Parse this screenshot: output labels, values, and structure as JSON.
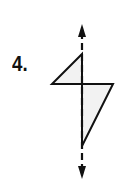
{
  "problem": {
    "number_label": "4."
  },
  "figure": {
    "shape": "kite",
    "symmetry_line": "vertical dashed line with arrowheads at both ends",
    "colors": {
      "stroke": "#111111",
      "fill": "#f2f2f2"
    }
  }
}
